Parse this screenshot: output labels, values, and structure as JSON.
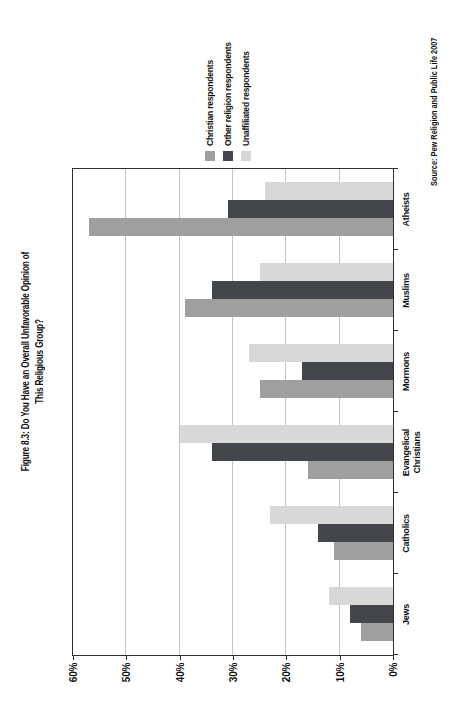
{
  "figure": {
    "title_line1": "Figure 8.3: Do You Have an Overall Unfavorable Opinion of",
    "title_line2": "This Religious Group?",
    "source": "Source: Pew Religion and Public Life 2007"
  },
  "chart_data": {
    "type": "bar",
    "title": "Figure 8.3: Do You Have an Overall Unfavorable Opinion of This Religious Group?",
    "note": "Column chart printed rotated 90 degrees counterclockwise on the page",
    "categories": [
      "Jews",
      "Catholics",
      "Evangelical Christians",
      "Mormons",
      "Muslims",
      "Atheists"
    ],
    "series": [
      {
        "name": "Christian respondents",
        "color": "#9f9f9f",
        "values": [
          6,
          11,
          16,
          25,
          39,
          57
        ]
      },
      {
        "name": "Other religion respondents",
        "color": "#43474b",
        "values": [
          8,
          14,
          34,
          17,
          34,
          31
        ]
      },
      {
        "name": "Unaffiliated respondents",
        "color": "#d8d8d8",
        "values": [
          12,
          23,
          40,
          27,
          25,
          24
        ]
      }
    ],
    "xlabel": "",
    "ylabel": "",
    "y_tick_labels": [
      "0%",
      "10%",
      "20%",
      "30%",
      "40%",
      "50%",
      "60%"
    ],
    "ylim": [
      0,
      60
    ],
    "grid": true,
    "gridline_color": "#c3c3c3",
    "axis_color": "#2e2e2e",
    "legend_position": "right of plot",
    "source": "Source: Pew Religion and Public Life 2007"
  }
}
